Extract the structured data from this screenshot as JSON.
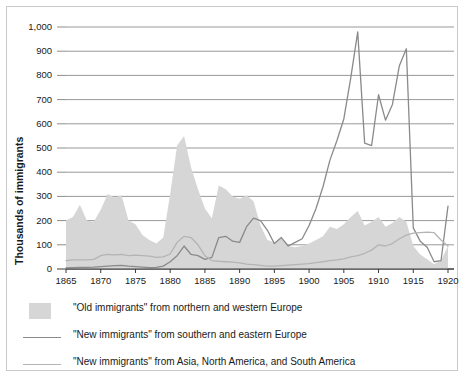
{
  "chart_data": {
    "type": "area",
    "title": "",
    "xlabel": "",
    "ylabel": "Thousands of immigrants",
    "xlim": [
      1865,
      1920
    ],
    "ylim": [
      0,
      1000
    ],
    "grid": true,
    "legend_position": "below",
    "y_ticks": [
      "0",
      "100",
      "200",
      "300",
      "400",
      "500",
      "600",
      "700",
      "800",
      "900",
      "1,000"
    ],
    "y_tick_values": [
      0,
      100,
      200,
      300,
      400,
      500,
      600,
      700,
      800,
      900,
      1000
    ],
    "x_ticks": [
      "1865",
      "1870",
      "1875",
      "1880",
      "1885",
      "1890",
      "1895",
      "1900",
      "1905",
      "1910",
      "1915",
      "1920"
    ],
    "x_tick_values": [
      1865,
      1870,
      1875,
      1880,
      1885,
      1890,
      1895,
      1900,
      1905,
      1910,
      1915,
      1920
    ],
    "x": [
      1865,
      1866,
      1867,
      1868,
      1869,
      1870,
      1871,
      1872,
      1873,
      1874,
      1875,
      1876,
      1877,
      1878,
      1879,
      1880,
      1881,
      1882,
      1883,
      1884,
      1885,
      1886,
      1887,
      1888,
      1889,
      1890,
      1891,
      1892,
      1893,
      1894,
      1895,
      1896,
      1897,
      1898,
      1899,
      1900,
      1901,
      1902,
      1903,
      1904,
      1905,
      1906,
      1907,
      1908,
      1909,
      1910,
      1911,
      1912,
      1913,
      1914,
      1915,
      1916,
      1917,
      1918,
      1919,
      1920
    ],
    "series": [
      {
        "name": "\"Old immigrants\" from northern and western Europe",
        "type": "area",
        "color": "#d6d6d6",
        "values": [
          200,
          215,
          265,
          200,
          195,
          245,
          310,
          295,
          305,
          200,
          185,
          140,
          120,
          105,
          130,
          310,
          510,
          550,
          420,
          330,
          250,
          210,
          345,
          330,
          300,
          290,
          305,
          280,
          180,
          120,
          110,
          130,
          95,
          90,
          95,
          105,
          120,
          135,
          175,
          165,
          185,
          215,
          240,
          180,
          195,
          215,
          175,
          190,
          215,
          195,
          95,
          60,
          40,
          20,
          35,
          95
        ]
      },
      {
        "name": "\"New immigrants\" from southern and eastern Europe",
        "type": "line",
        "color": "#8a8a8a",
        "values": [
          5,
          6,
          7,
          7,
          8,
          10,
          12,
          14,
          15,
          12,
          10,
          8,
          6,
          7,
          12,
          30,
          55,
          95,
          60,
          55,
          40,
          48,
          130,
          135,
          115,
          110,
          175,
          210,
          200,
          160,
          105,
          130,
          95,
          110,
          125,
          180,
          250,
          340,
          450,
          530,
          620,
          790,
          980,
          520,
          510,
          720,
          615,
          680,
          840,
          910,
          170,
          115,
          90,
          30,
          35,
          260
        ]
      },
      {
        "name": "\"New immigrants\" from Asia, North America, and South America",
        "type": "line",
        "color": "#b4b4b4",
        "values": [
          35,
          38,
          38,
          38,
          40,
          55,
          60,
          58,
          60,
          55,
          57,
          55,
          53,
          48,
          50,
          62,
          110,
          135,
          130,
          100,
          55,
          35,
          32,
          30,
          28,
          25,
          20,
          18,
          15,
          12,
          12,
          14,
          16,
          18,
          20,
          22,
          26,
          30,
          35,
          38,
          42,
          50,
          55,
          65,
          78,
          100,
          95,
          105,
          125,
          140,
          148,
          150,
          152,
          150,
          120,
          95
        ]
      }
    ]
  },
  "legend": {
    "items": [
      {
        "marker": "area-swatch",
        "label": "\"Old immigrants\" from northern and western Europe"
      },
      {
        "marker": "line-swatch-dark",
        "label": "\"New immigrants\" from southern and eastern Europe"
      },
      {
        "marker": "line-swatch-light",
        "label": "\"New immigrants\" from Asia, North America, and South America"
      }
    ]
  },
  "colors": {
    "area_fill": "#d6d6d6",
    "line_dark": "#8a8a8a",
    "line_light": "#b4b4b4",
    "gridline": "#8d8d8d",
    "axis": "#3a3a3a",
    "frame": "#c9c9c9",
    "text": "#1a1a1a"
  }
}
